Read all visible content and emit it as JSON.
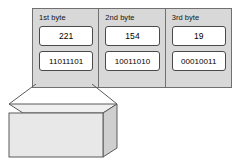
{
  "diagram": {
    "colors": {
      "panel_fill": "#d8d8d8",
      "panel_stroke": "#707070",
      "box_fill": "#ffffff",
      "box_stroke": "#4a4a4a",
      "block_front_fill": "#e8e8e8",
      "block_top_fill": "#efefef",
      "block_side_fill": "#cfcfcf",
      "block_stroke": "#5a5a5a",
      "text": "#0d0d0d"
    },
    "columns": [
      {
        "label": "1st byte",
        "decimal": "221",
        "binary": "11011101"
      },
      {
        "label": "2nd byte",
        "decimal": "154",
        "binary": "10011010"
      },
      {
        "label": "3rd byte",
        "decimal": "19",
        "binary": "00010011"
      }
    ],
    "callout": {
      "label": "1101 1101",
      "source_column_index": 0,
      "description": "expanded-first-byte-block"
    }
  }
}
